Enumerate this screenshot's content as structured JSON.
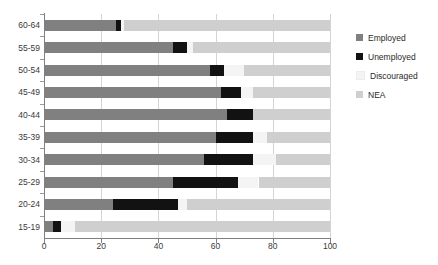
{
  "chart_data": {
    "type": "bar",
    "orientation": "horizontal",
    "stacked": true,
    "stack_total": 100,
    "title": "",
    "subtitle": "",
    "xlabel": "",
    "ylabel": "",
    "xlim": [
      0,
      100
    ],
    "xticks": [
      0,
      20,
      40,
      60,
      80,
      100
    ],
    "grid": true,
    "legend_position": "right",
    "categories": [
      "60-64",
      "55-59",
      "50-54",
      "45-49",
      "40-44",
      "35-39",
      "30-34",
      "25-29",
      "20-24",
      "15-19"
    ],
    "series": [
      {
        "name": "Employed",
        "color": "#808080",
        "values": [
          25,
          45,
          58,
          62,
          64,
          60,
          56,
          45,
          24,
          3
        ]
      },
      {
        "name": "Unemployed",
        "color": "#121212",
        "values": [
          2,
          5,
          5,
          7,
          9,
          13,
          17,
          23,
          23,
          3
        ]
      },
      {
        "name": "Discouraged",
        "color": "#f4f4f4",
        "values": [
          1,
          2,
          7,
          4,
          0,
          5,
          8,
          7,
          3,
          5
        ]
      },
      {
        "name": "NEA",
        "color": "#cfcfcf",
        "values": [
          72,
          48,
          30,
          27,
          27,
          22,
          19,
          25,
          50,
          89
        ]
      }
    ],
    "legend_entries": [
      {
        "label": "Employed",
        "color": "#808080"
      },
      {
        "label": "Unemployed",
        "color": "#121212"
      },
      {
        "label": "Discouraged",
        "color": "#f4f4f4"
      },
      {
        "label": "NEA",
        "color": "#cfcfcf"
      }
    ],
    "axis_color": "#808080",
    "grid_color": "#d4d4d4",
    "tick_label_color": "#3a3a3a",
    "background": "#ffffff"
  }
}
